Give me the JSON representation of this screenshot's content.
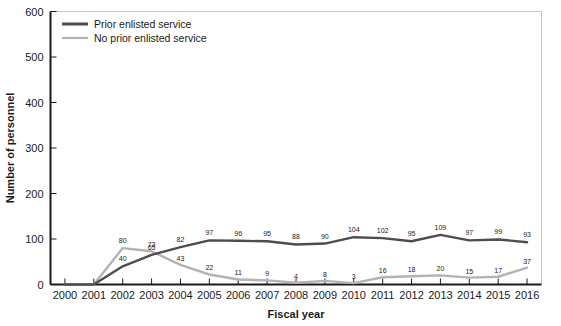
{
  "chart_data": {
    "type": "line",
    "title": "",
    "xlabel": "Fiscal year",
    "ylabel": "Number of personnel",
    "categories": [
      2000,
      2001,
      2002,
      2003,
      2004,
      2005,
      2006,
      2007,
      2008,
      2009,
      2010,
      2011,
      2012,
      2013,
      2014,
      2015,
      2016
    ],
    "xtick_labels": [
      "2000",
      "2001",
      "2002",
      "2003",
      "2004",
      "2005",
      "2006",
      "2007",
      "2008",
      "2009",
      "2010",
      "2011",
      "2012",
      "2013",
      "2014",
      "2015",
      "2016"
    ],
    "ylim": [
      0,
      600
    ],
    "ytick_values": [
      0,
      100,
      200,
      300,
      400,
      500,
      600
    ],
    "ytick_labels": [
      "0",
      "100",
      "200",
      "300",
      "400",
      "500",
      "600"
    ],
    "grid": false,
    "legend_position": "top-left-inside",
    "series": [
      {
        "name": "Prior enlisted service",
        "color": "#4d4d4d",
        "values": [
          0,
          0,
          40,
          65,
          82,
          97,
          96,
          95,
          88,
          90,
          104,
          102,
          95,
          109,
          97,
          99,
          93
        ],
        "labels": [
          "",
          "",
          "40",
          "65",
          "82",
          "97",
          "96",
          "95",
          "88",
          "90",
          "104",
          "102",
          "95",
          "109",
          "97",
          "99",
          "93"
        ]
      },
      {
        "name": "No prior enlisted service",
        "color": "#b3b3b3",
        "values": [
          0,
          0,
          80,
          73,
          43,
          22,
          11,
          9,
          4,
          8,
          3,
          16,
          18,
          20,
          15,
          17,
          37
        ],
        "labels": [
          "",
          "",
          "80",
          "73",
          "43",
          "22",
          "11",
          "9",
          "4",
          "8",
          "3",
          "16",
          "18",
          "20",
          "15",
          "17",
          "37"
        ]
      }
    ]
  }
}
